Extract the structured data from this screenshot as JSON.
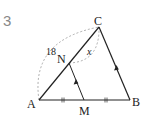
{
  "problem": {
    "number": "3"
  },
  "figure": {
    "points": {
      "A": {
        "label": "A",
        "x": 39,
        "y": 100
      },
      "B": {
        "label": "B",
        "x": 130,
        "y": 100
      },
      "C": {
        "label": "C",
        "x": 99,
        "y": 27
      },
      "M": {
        "label": "M",
        "x": 84,
        "y": 100
      },
      "N": {
        "label": "N",
        "x": 69,
        "y": 63
      }
    },
    "labels": {
      "length_AC": "18",
      "unknown_NC": "x"
    },
    "colors": {
      "line": "#222222",
      "dashed": "#999999",
      "number": "#888888"
    }
  }
}
